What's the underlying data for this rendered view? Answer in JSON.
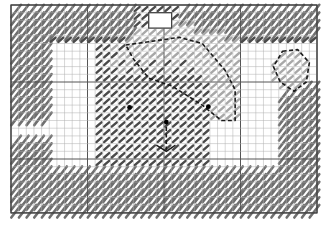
{
  "chart": {
    "grid": {
      "cols": 40,
      "rows": 27,
      "x0": 11,
      "y0": 5,
      "cell_w": 7.65,
      "cell_h": 7.7,
      "major_every": 10
    },
    "colors": {
      "background": "#ffffff",
      "grid_minor": "#b0b0b0",
      "grid_major": "#555555",
      "border_stitch": "#6f6f6f",
      "dark_stitch": "#4a4a4a",
      "light_stitch": "#a8a8a8",
      "outline": "#1a1a1a",
      "bead": "#000000"
    },
    "legend": {
      "border": "long diagonal stitch",
      "dark": "dark tent stitch",
      "light": "light tent stitch",
      "outline": "backstitch outline",
      "bead": "french knot"
    }
  }
}
